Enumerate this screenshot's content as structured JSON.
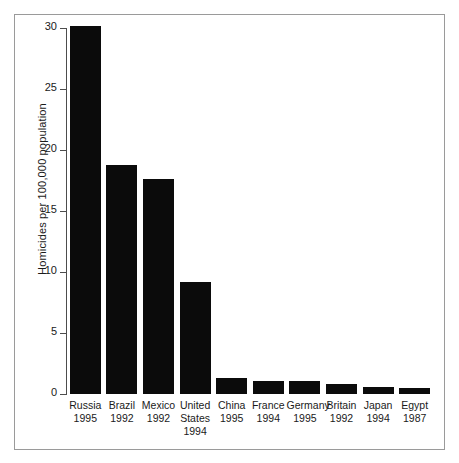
{
  "chart_data": {
    "type": "bar",
    "title": "",
    "xlabel": "",
    "ylabel": "Homicides per 100,000 population",
    "ylim": [
      0,
      30
    ],
    "yticks": [
      0,
      5,
      10,
      15,
      20,
      25,
      30
    ],
    "ytick_labels": [
      "0",
      "5",
      "10",
      "15",
      "20",
      "25",
      "30"
    ],
    "grid": false,
    "legend": false,
    "bar_color": "#0b0b0b",
    "frame_color": "#9a9a9a",
    "axis_color": "#4d4d4d",
    "categories": [
      "Russia",
      "Brazil",
      "Mexico",
      "United States",
      "China",
      "France",
      "Germany",
      "Britain",
      "Japan",
      "Egypt"
    ],
    "category_lines": [
      [
        "Russia",
        "1995"
      ],
      [
        "Brazil",
        "1992"
      ],
      [
        "Mexico",
        "1992"
      ],
      [
        "United States",
        "1994"
      ],
      [
        "China",
        "1995"
      ],
      [
        "France",
        "1994"
      ],
      [
        "Germany",
        "1995"
      ],
      [
        "Britain",
        "1992"
      ],
      [
        "Japan",
        "1994"
      ],
      [
        "Egypt",
        "1987"
      ]
    ],
    "years": [
      "1995",
      "1992",
      "1992",
      "1994",
      "1995",
      "1994",
      "1995",
      "1992",
      "1994",
      "1987"
    ],
    "values": [
      30.2,
      18.8,
      17.6,
      9.2,
      1.3,
      1.1,
      1.1,
      0.8,
      0.6,
      0.5
    ]
  },
  "axis": {
    "y_title": "Homicides per 100,000 population"
  },
  "labels": {
    "russia_name": "Russia",
    "russia_year": "1995",
    "brazil_name": "Brazil",
    "brazil_year": "1992",
    "mexico_name": "Mexico",
    "mexico_year": "1992",
    "us_name_1": "United",
    "us_name_2": "States",
    "us_year": "1994",
    "china_name": "China",
    "china_year": "1995",
    "france_name": "France",
    "france_year": "1994",
    "germany_name": "Germany",
    "germany_year": "1995",
    "britain_name": "Britain",
    "britain_year": "1992",
    "japan_name": "Japan",
    "japan_year": "1994",
    "egypt_name": "Egypt",
    "egypt_year": "1987"
  }
}
